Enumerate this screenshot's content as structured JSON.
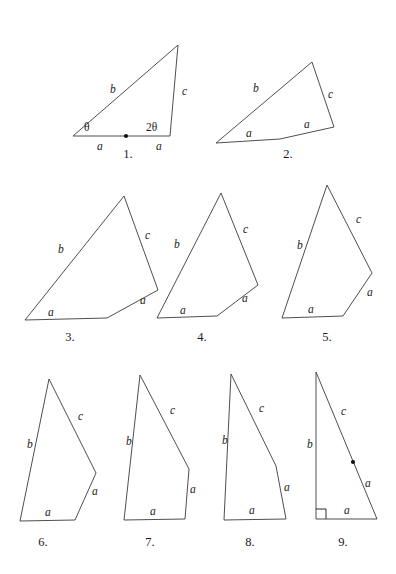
{
  "sheet": {
    "title": "Sequence of triangle and quadrilateral figures with sides a, b, c",
    "width": 396,
    "height": 574,
    "background": "#ffffff",
    "stroke_color": "#3b3b3b",
    "label_color": "#1a1a1a"
  },
  "figures": [
    {
      "id": 1,
      "caption": "1.",
      "caption_x": 128,
      "caption_y": 158,
      "shape": "triangle",
      "points": "73,136 178,45 170,136 73,136",
      "labels": [
        {
          "text": "b",
          "x": 110,
          "y": 93,
          "style": "side"
        },
        {
          "text": "c",
          "x": 182,
          "y": 95,
          "style": "side"
        },
        {
          "text": "a",
          "x": 97,
          "y": 150,
          "style": "side"
        },
        {
          "text": "a",
          "x": 156,
          "y": 150,
          "style": "side"
        },
        {
          "text": "θ",
          "x": 84,
          "y": 131,
          "style": "angle"
        },
        {
          "text": "2θ",
          "x": 146,
          "y": 131,
          "style": "angle"
        }
      ],
      "dots": [
        {
          "cx": 126,
          "cy": 136,
          "r": 2.1
        }
      ],
      "rightangle": null
    },
    {
      "id": 2,
      "caption": "2.",
      "caption_x": 288,
      "caption_y": 158,
      "shape": "quadrilateral",
      "points": "216,143 312,62 334,127 280,139 216,143",
      "labels": [
        {
          "text": "b",
          "x": 253,
          "y": 92,
          "style": "side"
        },
        {
          "text": "c",
          "x": 328,
          "y": 98,
          "style": "side"
        },
        {
          "text": "a",
          "x": 246,
          "y": 137,
          "style": "side"
        },
        {
          "text": "a",
          "x": 304,
          "y": 128,
          "style": "side"
        }
      ],
      "dots": [],
      "rightangle": null
    },
    {
      "id": 3,
      "caption": "3.",
      "caption_x": 70,
      "caption_y": 341,
      "shape": "quadrilateral",
      "points": "25,320 124,196 158,290 107,318 25,320",
      "labels": [
        {
          "text": "b",
          "x": 58,
          "y": 253,
          "style": "side"
        },
        {
          "text": "c",
          "x": 145,
          "y": 239,
          "style": "side"
        },
        {
          "text": "a",
          "x": 48,
          "y": 316,
          "style": "side"
        },
        {
          "text": "a",
          "x": 140,
          "y": 304,
          "style": "side"
        }
      ],
      "dots": [],
      "rightangle": null
    },
    {
      "id": 4,
      "caption": "4.",
      "caption_x": 202,
      "caption_y": 341,
      "shape": "quadrilateral",
      "points": "157,318 221,193 258,285 217,316 157,318",
      "labels": [
        {
          "text": "b",
          "x": 174,
          "y": 248,
          "style": "side"
        },
        {
          "text": "c",
          "x": 243,
          "y": 233,
          "style": "side"
        },
        {
          "text": "a",
          "x": 180,
          "y": 314,
          "style": "side"
        },
        {
          "text": "a",
          "x": 242,
          "y": 302,
          "style": "side"
        }
      ],
      "dots": [],
      "rightangle": null
    },
    {
      "id": 5,
      "caption": "5.",
      "caption_x": 327,
      "caption_y": 341,
      "shape": "quadrilateral",
      "points": "282,318 327,185 372,273 343,316 282,318",
      "labels": [
        {
          "text": "b",
          "x": 297,
          "y": 249,
          "style": "side"
        },
        {
          "text": "c",
          "x": 356,
          "y": 223,
          "style": "side"
        },
        {
          "text": "a",
          "x": 308,
          "y": 313,
          "style": "side"
        },
        {
          "text": "a",
          "x": 367,
          "y": 296,
          "style": "side"
        }
      ],
      "dots": [],
      "rightangle": null
    },
    {
      "id": 6,
      "caption": "6.",
      "caption_x": 43,
      "caption_y": 546,
      "shape": "quadrilateral",
      "points": "20,521 49,379 96,473 75,520 20,521",
      "labels": [
        {
          "text": "b",
          "x": 27,
          "y": 448,
          "style": "side"
        },
        {
          "text": "c",
          "x": 78,
          "y": 420,
          "style": "side"
        },
        {
          "text": "a",
          "x": 45,
          "y": 516,
          "style": "side"
        },
        {
          "text": "a",
          "x": 92,
          "y": 495,
          "style": "side"
        }
      ],
      "dots": [],
      "rightangle": null
    },
    {
      "id": 7,
      "caption": "7.",
      "caption_x": 150,
      "caption_y": 546,
      "shape": "quadrilateral",
      "points": "124,520 140,375 189,469 185,519 124,520",
      "labels": [
        {
          "text": "b",
          "x": 126,
          "y": 445,
          "style": "side"
        },
        {
          "text": "c",
          "x": 170,
          "y": 414,
          "style": "side"
        },
        {
          "text": "a",
          "x": 150,
          "y": 515,
          "style": "side"
        },
        {
          "text": "a",
          "x": 190,
          "y": 493,
          "style": "side"
        }
      ],
      "dots": [],
      "rightangle": null
    },
    {
      "id": 8,
      "caption": "8.",
      "caption_x": 250,
      "caption_y": 546,
      "shape": "quadrilateral",
      "points": "224,520 231,374 276,466 286,519 224,520",
      "labels": [
        {
          "text": "b",
          "x": 222,
          "y": 444,
          "style": "side"
        },
        {
          "text": "c",
          "x": 259,
          "y": 412,
          "style": "side"
        },
        {
          "text": "a",
          "x": 249,
          "y": 514,
          "style": "side"
        },
        {
          "text": "a",
          "x": 284,
          "y": 491,
          "style": "side"
        }
      ],
      "dots": [],
      "rightangle": null
    },
    {
      "id": 9,
      "caption": "9.",
      "caption_x": 343,
      "caption_y": 546,
      "shape": "right-triangle",
      "points": "316,519 316,372 377,519 316,519",
      "labels": [
        {
          "text": "b",
          "x": 307,
          "y": 448,
          "style": "side"
        },
        {
          "text": "c",
          "x": 341,
          "y": 415,
          "style": "side"
        },
        {
          "text": "a",
          "x": 365,
          "y": 487,
          "style": "side"
        },
        {
          "text": "a",
          "x": 344,
          "y": 514,
          "style": "side"
        }
      ],
      "dots": [
        {
          "cx": 353,
          "cy": 462,
          "r": 2.1
        }
      ],
      "rightangle": {
        "points": "316,509 326,509 326,519"
      }
    }
  ]
}
